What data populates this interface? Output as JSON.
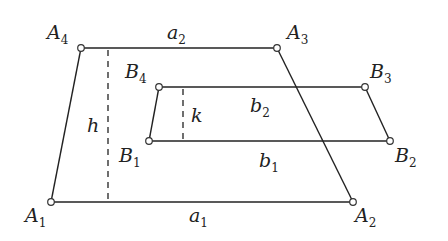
{
  "diagram": {
    "trapezoid_A": {
      "vertices": [
        {
          "name": "A1",
          "base": "A",
          "sub": "1",
          "x": 51,
          "y": 202
        },
        {
          "name": "A2",
          "base": "A",
          "sub": "2",
          "x": 353,
          "y": 202
        },
        {
          "name": "A3",
          "base": "A",
          "sub": "3",
          "x": 277,
          "y": 48
        },
        {
          "name": "A4",
          "base": "A",
          "sub": "4",
          "x": 81,
          "y": 48
        }
      ],
      "sides": {
        "a1": {
          "base": "a",
          "sub": "1"
        },
        "a2": {
          "base": "a",
          "sub": "2"
        }
      },
      "height": {
        "label": "h"
      }
    },
    "trapezoid_B": {
      "vertices": [
        {
          "name": "B1",
          "base": "B",
          "sub": "1",
          "x": 149,
          "y": 141
        },
        {
          "name": "B2",
          "base": "B",
          "sub": "2",
          "x": 390,
          "y": 141
        },
        {
          "name": "B3",
          "base": "B",
          "sub": "3",
          "x": 365,
          "y": 87
        },
        {
          "name": "B4",
          "base": "B",
          "sub": "4",
          "x": 159,
          "y": 87
        }
      ],
      "sides": {
        "b1": {
          "base": "b",
          "sub": "1"
        },
        "b2": {
          "base": "b",
          "sub": "2"
        }
      },
      "height": {
        "label": "k"
      }
    }
  }
}
